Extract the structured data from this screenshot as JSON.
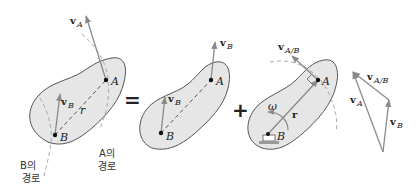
{
  "diagram": {
    "colors": {
      "body_fill": "#e6e6e6",
      "body_stroke": "#555555",
      "arrow": "#8a8a8a",
      "dash": "#555555",
      "path_dash": "#aaaaaa",
      "text": "#222222"
    },
    "panel1": {
      "point_a": "A",
      "point_b": "B",
      "r_label": "r",
      "va_label": "v",
      "va_sub": "A",
      "vb_label": "v",
      "vb_sub": "B",
      "path_a_line1": "A의",
      "path_a_line2": "경로",
      "path_b_line1": "B의",
      "path_b_line2": "경로"
    },
    "equals": "=",
    "panel2": {
      "point_a": "A",
      "point_b": "B",
      "va_label": "v",
      "va_sub": "B",
      "vb_label": "v",
      "vb_sub": "B"
    },
    "plus": "+",
    "panel3": {
      "point_a": "A",
      "point_b": "B",
      "r_label": "r",
      "omega_label": "ω",
      "vab_label": "v",
      "vab_sub": "A/B"
    },
    "triangle": {
      "vab_label": "v",
      "vab_sub": "A/B",
      "va_label": "v",
      "va_sub": "A",
      "vb_label": "v",
      "vb_sub": "B"
    }
  }
}
